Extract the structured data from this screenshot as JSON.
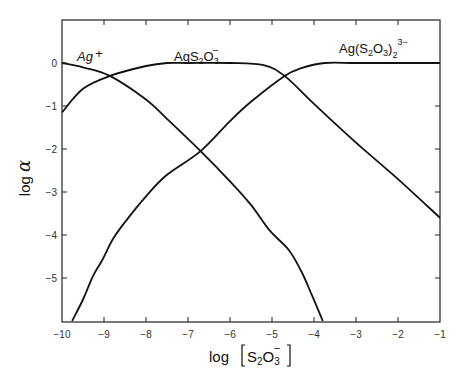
{
  "chart_data": {
    "type": "line",
    "title": "",
    "xlabel": "log [S2O3−]",
    "ylabel": "log α",
    "xlim": [
      -10,
      -1
    ],
    "ylim": [
      -6,
      0.9
    ],
    "grid": false,
    "legend": "inline curve labels",
    "x_ticks": [
      -10,
      -9,
      -8,
      -7,
      -6,
      -5,
      -4,
      -3,
      -2,
      -1
    ],
    "x_tick_labels": [
      "−10",
      "−9",
      "−8",
      "−7",
      "−6",
      "−5",
      "−4",
      "−3",
      "−2",
      "−1"
    ],
    "y_ticks": [
      0,
      -1,
      -2,
      -3,
      -4,
      -5
    ],
    "y_tick_labels": [
      "0",
      "−1",
      "−2",
      "−3",
      "−4",
      "−5"
    ],
    "series": [
      {
        "name": "Ag+",
        "label": "Ag+",
        "x": [
          -10,
          -9.5,
          -8.86,
          -8,
          -7.5,
          -6.7,
          -6,
          -5.5,
          -5.05,
          -4.6,
          -4.3,
          -4.05,
          -3.79
        ],
        "y": [
          0,
          -0.1,
          -0.3,
          -0.85,
          -1.3,
          -2.05,
          -2.75,
          -3.3,
          -3.9,
          -4.35,
          -4.85,
          -5.4,
          -6
        ]
      },
      {
        "name": "AgS2O3−",
        "label": "AgS2O3−",
        "x": [
          -10,
          -9.5,
          -8.86,
          -8,
          -7.5,
          -7,
          -6,
          -5.2,
          -4.7,
          -4,
          -3,
          -2,
          -1
        ],
        "y": [
          -1.15,
          -0.6,
          -0.3,
          -0.07,
          0,
          0,
          0,
          -0.05,
          -0.3,
          -0.95,
          -1.85,
          -2.7,
          -3.6
        ]
      },
      {
        "name": "Ag(S2O3)2 3−",
        "label": "Ag(S2O3)23−",
        "x": [
          -9.76,
          -9.5,
          -9.26,
          -9.05,
          -8.79,
          -8.5,
          -8,
          -7.5,
          -6.7,
          -6,
          -5.5,
          -4.7,
          -4.3,
          -3.75,
          -3,
          -2,
          -1
        ],
        "y": [
          -6,
          -5.5,
          -4.95,
          -4.6,
          -4.1,
          -3.7,
          -3.1,
          -2.6,
          -2.05,
          -1.35,
          -0.9,
          -0.3,
          -0.12,
          0,
          0,
          0,
          0
        ]
      }
    ],
    "annotations": [
      "Ag+",
      "AgS2O3−",
      "Ag(S2O3)2 3−"
    ]
  },
  "labels": {
    "y_axis_title_main": "log ",
    "y_axis_title_greek": "α",
    "x_axis_title_log": "log",
    "x_axis_title_s": "S",
    "x_axis_title_2": "2",
    "x_axis_title_o": "O",
    "x_axis_title_3": "3",
    "x_axis_title_charge": "−",
    "curve_ag": "Ag",
    "curve_ag_plus": "+",
    "curve_ags2o3_ag": "AgS",
    "curve_ags2o3_2": "2",
    "curve_ags2o3_o": "O",
    "curve_ags2o3_3": "3",
    "curve_ags2o3_charge": "−",
    "curve_complex_prefix": "Ag(S",
    "curve_complex_2": "2",
    "curve_complex_o": "O",
    "curve_complex_3": "3",
    "curve_complex_close": ")",
    "curve_complex_sub2": "2",
    "curve_complex_charge": "3−"
  },
  "caption": ""
}
